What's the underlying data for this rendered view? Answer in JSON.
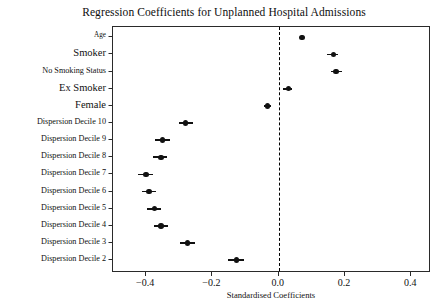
{
  "chart_data": {
    "type": "scatter",
    "title": "Regression Coefficients for Unplanned Hospital Admissions",
    "xlabel": "Standardised Coefficients",
    "ylabel": "",
    "xlim": [
      -0.5,
      0.46
    ],
    "xticks": [
      -0.4,
      -0.2,
      0.0,
      0.2,
      0.4
    ],
    "xticklabels": [
      "-0.4",
      "-0.2",
      "0.0",
      "0.2",
      "0.4"
    ],
    "grid": false,
    "legend": null,
    "reference_line": {
      "value": 0.0,
      "style": "dashed",
      "color": "#000000"
    },
    "categories": [
      "Age",
      "Smoker",
      "No Smoking Status",
      "Ex Smoker",
      "Female",
      "Dispersion Decile 10",
      "Dispersion Decile 9",
      "Dispersion Decile 8",
      "Dispersion Decile 7",
      "Dispersion Decile 6",
      "Dispersion Decile 5",
      "Dispersion Decile 4",
      "Dispersion Decile 3",
      "Dispersion Decile 2"
    ],
    "points": [
      {
        "label": "Age",
        "value": 0.071,
        "ci_low": 0.068,
        "ci_high": 0.074,
        "label_size": 7.2
      },
      {
        "label": "Smoker",
        "value": 0.165,
        "ci_low": 0.147,
        "ci_high": 0.178,
        "label_size": 10.5
      },
      {
        "label": "No Smoking Status",
        "value": 0.173,
        "ci_low": 0.158,
        "ci_high": 0.19,
        "label_size": 8.2
      },
      {
        "label": "Ex Smoker",
        "value": 0.029,
        "ci_low": 0.014,
        "ci_high": 0.04,
        "label_size": 10.5
      },
      {
        "label": "Female",
        "value": -0.034,
        "ci_low": -0.045,
        "ci_high": -0.024,
        "label_size": 10.5
      },
      {
        "label": "Dispersion Decile 10",
        "value": -0.281,
        "ci_low": -0.3,
        "ci_high": -0.258,
        "label_size": 8.2
      },
      {
        "label": "Dispersion Decile 9",
        "value": -0.35,
        "ci_low": -0.374,
        "ci_high": -0.328,
        "label_size": 8.2
      },
      {
        "label": "Dispersion Decile 8",
        "value": -0.355,
        "ci_low": -0.38,
        "ci_high": -0.336,
        "label_size": 8.2
      },
      {
        "label": "Dispersion Decile 7",
        "value": -0.4,
        "ci_low": -0.425,
        "ci_high": -0.379,
        "label_size": 8.2
      },
      {
        "label": "Dispersion Decile 6",
        "value": -0.391,
        "ci_low": -0.412,
        "ci_high": -0.369,
        "label_size": 8.2
      },
      {
        "label": "Dispersion Decile 5",
        "value": -0.375,
        "ci_low": -0.398,
        "ci_high": -0.355,
        "label_size": 8.2
      },
      {
        "label": "Dispersion Decile 4",
        "value": -0.355,
        "ci_low": -0.377,
        "ci_high": -0.335,
        "label_size": 8.2
      },
      {
        "label": "Dispersion Decile 3",
        "value": -0.275,
        "ci_low": -0.299,
        "ci_high": -0.252,
        "label_size": 8.2
      },
      {
        "label": "Dispersion Decile 2",
        "value": -0.128,
        "ci_low": -0.153,
        "ci_high": -0.106,
        "label_size": 8.2
      }
    ]
  }
}
